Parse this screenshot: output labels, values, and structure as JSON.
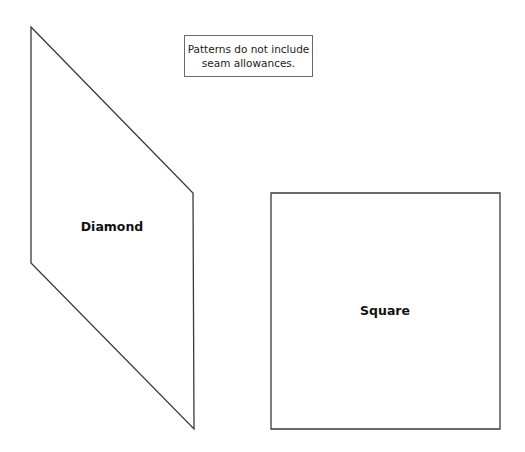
{
  "note": {
    "line1": "Patterns do not include",
    "line2": "seam allowances."
  },
  "shapes": [
    {
      "name": "Diamond",
      "label": "Diamond",
      "points": "31,27 193,193 194,429 31,263",
      "label_x": 112,
      "label_y": 226
    },
    {
      "name": "Square",
      "label": "Square",
      "points": "271,193 500,193 500,429 271,429",
      "label_x": 385,
      "label_y": 310
    }
  ],
  "style": {
    "stroke": "#3a3a3a",
    "stroke_width": 1.3
  }
}
